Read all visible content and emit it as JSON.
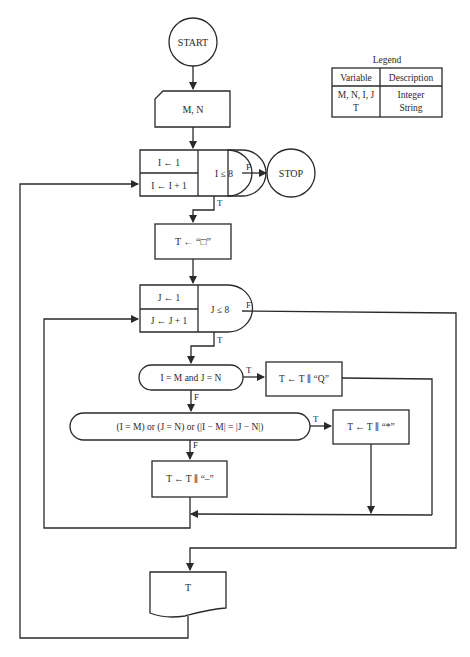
{
  "legend": {
    "title": "Legend",
    "headers": [
      "Variable",
      "Description"
    ],
    "rows": [
      {
        "variable": "M, N, I, J",
        "description": "Integer"
      },
      {
        "variable": "T",
        "description": "String"
      }
    ]
  },
  "nodes": {
    "start": "START",
    "input": "M, N",
    "loop_i": {
      "init": "I ← 1",
      "step": "I ← I + 1",
      "test": "I ≤ 8"
    },
    "stop": "STOP",
    "init_t": "T ← “□”",
    "loop_j": {
      "init": "J ← 1",
      "step": "J ← J + 1",
      "test": "J ≤ 8"
    },
    "decision_queen": "I = M and J = N",
    "append_q": "T ← T ∥ “Q”",
    "decision_attack": "(I = M) or (J = N) or (|I − M| = |J − N|)",
    "append_star": "T ← T ∥ “*”",
    "append_dash": "T ← T ∥ “–”",
    "output": "T"
  },
  "edge_labels": {
    "true": "T",
    "false": "F"
  }
}
